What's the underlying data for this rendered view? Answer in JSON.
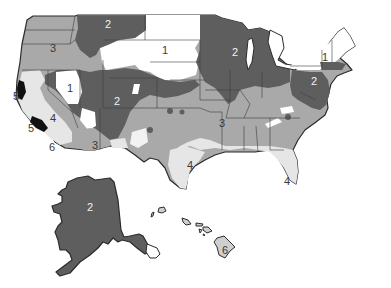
{
  "map": {
    "title": "",
    "type": "choropleth",
    "region": "United States",
    "colors": {
      "zone_1": "#ffffff",
      "zone_2": "#5e5e5e",
      "zone_3": "#a9a9a9",
      "zone_4": "#e6e6e6",
      "zone_5": "#111111",
      "zone_6": "#d0d0d0",
      "border": "#2b2b2b",
      "state_line": "#3d3d3d"
    },
    "labels": [
      {
        "id": "pnw",
        "text": "3",
        "x": 53,
        "y": 48,
        "tone": "dark"
      },
      {
        "id": "montana",
        "text": "2",
        "x": 108,
        "y": 24,
        "tone": "light"
      },
      {
        "id": "dakotas",
        "text": "1",
        "x": 165,
        "y": 50,
        "tone": "dark"
      },
      {
        "id": "wisconsin",
        "text": "2",
        "x": 235,
        "y": 52,
        "tone": "light"
      },
      {
        "id": "new-england",
        "text": "1",
        "x": 325,
        "y": 57,
        "tone": "dark"
      },
      {
        "id": "mid-atlantic",
        "text": "2",
        "x": 314,
        "y": 81,
        "tone": "light"
      },
      {
        "id": "nevada",
        "text": "1",
        "x": 70,
        "y": 88,
        "tone": "dark"
      },
      {
        "id": "colorado",
        "text": "2",
        "x": 117,
        "y": 101,
        "tone": "light"
      },
      {
        "id": "ca-coast-north",
        "text": "5",
        "x": 16,
        "y": 96,
        "tone": "dark"
      },
      {
        "id": "california",
        "text": "4",
        "x": 53,
        "y": 118,
        "tone": "dark"
      },
      {
        "id": "ca-coast-south",
        "text": "5",
        "x": 31,
        "y": 128,
        "tone": "dark"
      },
      {
        "id": "ca-islands",
        "text": "6",
        "x": 52,
        "y": 147,
        "tone": "dark"
      },
      {
        "id": "arizona",
        "text": "3",
        "x": 95,
        "y": 145,
        "tone": "dark"
      },
      {
        "id": "central",
        "text": "3",
        "x": 222,
        "y": 123,
        "tone": "dark"
      },
      {
        "id": "texas-coast",
        "text": "4",
        "x": 190,
        "y": 165,
        "tone": "dark"
      },
      {
        "id": "florida",
        "text": "4",
        "x": 287,
        "y": 181,
        "tone": "dark"
      },
      {
        "id": "alaska",
        "text": "2",
        "x": 90,
        "y": 207,
        "tone": "light"
      },
      {
        "id": "hawaii",
        "text": "6",
        "x": 225,
        "y": 250,
        "tone": "dark"
      }
    ],
    "legend": []
  }
}
